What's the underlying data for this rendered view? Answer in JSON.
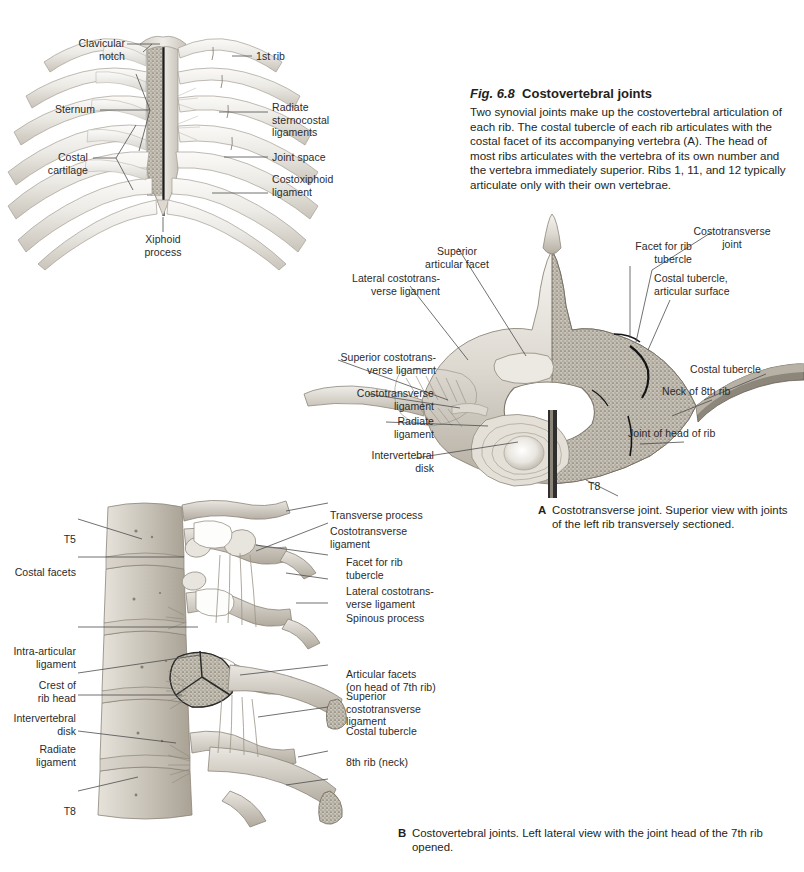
{
  "figure": {
    "number": "Fig. 6.8",
    "title": "Costovertebral joints",
    "description": "Two synovial joints make up the costovertebral articulation of each rib. The costal tubercle of each rib articulates with the costal facet of its accompanying vertebra (A). The head of most ribs articulates with the vertebra of its own number and the vertebra immediately superior. Ribs 1, 11, and 12 typically articulate only with their own vertebrae."
  },
  "panels": [
    {
      "id": "thorax",
      "labels": {
        "clavicular_notch": "Clavicular\nnotch",
        "sternum": "Sternum",
        "costal_cartilage": "Costal\ncartilage",
        "xiphoid_process": "Xiphoid\nprocess",
        "first_rib": "1st rib",
        "radiate_sternocostal_ligaments": "Radiate\nsternocostal\nligaments",
        "joint_space": "Joint space",
        "costoxiphoid_ligament": "Costoxiphoid\nligament"
      }
    },
    {
      "id": "A",
      "caption_tag": "A",
      "caption_text": "Costotransverse joint. Superior view with joints of the left rib transversely sectioned.",
      "labels": {
        "superior_articular_facet": "Superior\narticular facet",
        "lateral_costotransverse_ligament": "Lateral costotrans-\nverse ligament",
        "superior_costotransverse_ligament": "Superior costotrans-\nverse ligament",
        "costotransverse_ligament": "Costotransverse\nligament",
        "radiate_ligament": "Radiate\nligament",
        "intervertebral_disk": "Intervertebral\ndisk",
        "costotransverse_joint": "Costotransverse\njoint",
        "facet_for_rib_tubercle": "Facet for rib\ntubercle",
        "costal_tubercle_articular_surface": "Costal tubercle,\narticular surface",
        "costal_tubercle": "Costal tubercle",
        "neck_of_8th_rib": "Neck of 8th rib",
        "joint_of_head_of_rib": "Joint of head of rib",
        "t8": "T8"
      }
    },
    {
      "id": "B",
      "caption_tag": "B",
      "caption_text": "Costovertebral joints. Left lateral view with the joint head of the 7th rib opened.",
      "labels": {
        "t5": "T5",
        "costal_facets": "Costal facets",
        "intra_articular_ligament": "Intra-articular\nligament",
        "crest_of_rib_head": "Crest of\nrib head",
        "intervertebral_disk": "Intervertebral\ndisk",
        "radiate_ligament": "Radiate\nligament",
        "t8": "T8",
        "transverse_process": "Transverse process",
        "costotransverse_ligament": "Costotransverse\nligament",
        "facet_for_rib_tubercle": "Facet for rib\ntubercle",
        "lateral_costotransverse_ligament": "Lateral costotrans-\nverse ligament",
        "spinous_process": "Spinous process",
        "articular_facets": "Articular facets\n(on head of 7th rib)",
        "superior_costotransverse_ligament": "Superior\ncostotransverse\nligament",
        "costal_tubercle": "Costal tubercle",
        "eighth_rib_neck": "8th rib (neck)"
      }
    }
  ],
  "colors": {
    "text": "#231f20",
    "leader_line": "#4d4d4d",
    "bone_light": "#f0eeea",
    "bone_mid": "#d8d4cc",
    "bone_shadow": "#a9a49a",
    "cartilage": "#e6e4df",
    "trabecular": "#b9b3a8",
    "section_dark": "#3a3a3a",
    "background": "#ffffff"
  }
}
